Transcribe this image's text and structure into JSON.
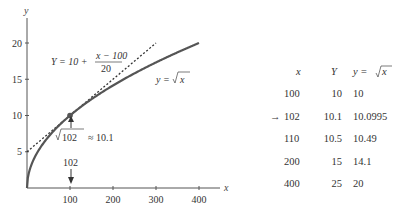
{
  "chart_data": {
    "type": "line",
    "title": "",
    "xlabel": "x",
    "ylabel": "y",
    "xlim": [
      0,
      450
    ],
    "ylim": [
      0,
      24
    ],
    "x_ticks": [
      100,
      200,
      300,
      400
    ],
    "y_ticks": [
      5,
      10,
      15,
      20
    ],
    "grid": false,
    "series": [
      {
        "name": "y = √x",
        "style": "solid",
        "function": "sqrt(x)",
        "x_range": [
          0,
          400
        ]
      },
      {
        "name": "Y = 10 + (x − 100)/20",
        "style": "dotted",
        "function": "10 + (x - 100)/20",
        "x_range": [
          0,
          300
        ]
      }
    ],
    "highlight_point": {
      "x": 100,
      "y": 10
    },
    "annotations": {
      "tangent_label_lhs": "Y = 10 + ",
      "tangent_label_num": "x − 100",
      "tangent_label_den": "20",
      "curve_label_lhs": "y = ",
      "curve_label_rad": "x",
      "approx_rad": "102",
      "approx_rhs": "≈ 10.1",
      "x_marker": "102"
    }
  },
  "table": {
    "headers": {
      "x": "x",
      "Y": "Y",
      "y_lhs": "y = ",
      "y_rad": "x"
    },
    "arrow": "→",
    "rows": [
      {
        "x": "100",
        "Y": "10",
        "y": "10",
        "highlight": false
      },
      {
        "x": "102",
        "Y": "10.1",
        "y": "10.0995",
        "highlight": true
      },
      {
        "x": "110",
        "Y": "10.5",
        "y": "10.49",
        "highlight": false
      },
      {
        "x": "200",
        "Y": "15",
        "y": "14.1",
        "highlight": false
      },
      {
        "x": "400",
        "Y": "25",
        "y": "20",
        "highlight": false
      }
    ]
  }
}
